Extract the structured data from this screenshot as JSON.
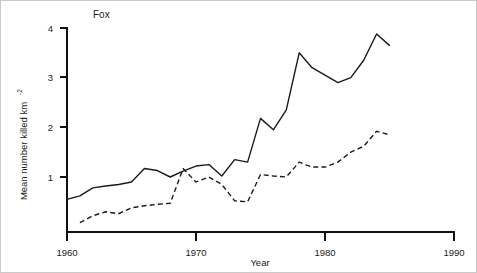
{
  "chart_data": {
    "type": "line",
    "title": "Fox",
    "xlabel": "Year",
    "ylabel": "Mean number killed km",
    "ylabel_superscript": "-2",
    "xlim": [
      1960,
      1990
    ],
    "ylim": [
      0,
      4
    ],
    "xticks": [
      1960,
      1970,
      1980,
      1990
    ],
    "yticks": [
      1,
      2,
      3,
      4
    ],
    "xtick_labels": [
      "1960",
      "1970",
      "1980",
      "1990"
    ],
    "ytick_labels": [
      "1",
      "2",
      "3",
      "4"
    ],
    "grid": false,
    "legend": "none",
    "series": [
      {
        "name": "solid-series",
        "style": "solid",
        "x": [
          1960,
          1961,
          1962,
          1963,
          1964,
          1965,
          1966,
          1967,
          1968,
          1969,
          1970,
          1971,
          1972,
          1973,
          1974,
          1975,
          1976,
          1977,
          1978,
          1979,
          1980,
          1981,
          1982,
          1983,
          1984,
          1985
        ],
        "values": [
          0.55,
          0.62,
          0.78,
          0.82,
          0.85,
          0.9,
          1.17,
          1.13,
          1.0,
          1.12,
          1.22,
          1.25,
          1.02,
          1.35,
          1.3,
          2.18,
          1.95,
          2.35,
          3.5,
          3.2,
          3.05,
          2.9,
          3.0,
          3.35,
          3.88,
          3.65
        ]
      },
      {
        "name": "dashed-series",
        "style": "dashed",
        "x": [
          1961,
          1962,
          1963,
          1964,
          1965,
          1966,
          1967,
          1968,
          1969,
          1970,
          1971,
          1972,
          1973,
          1974,
          1975,
          1976,
          1977,
          1978,
          1979,
          1980,
          1981,
          1982,
          1983,
          1984,
          1985
        ],
        "values": [
          0.08,
          0.22,
          0.3,
          0.26,
          0.38,
          0.42,
          0.45,
          0.47,
          1.17,
          0.9,
          1.0,
          0.85,
          0.52,
          0.5,
          1.05,
          1.02,
          1.0,
          1.3,
          1.2,
          1.2,
          1.3,
          1.5,
          1.62,
          1.92,
          1.85
        ]
      }
    ]
  }
}
